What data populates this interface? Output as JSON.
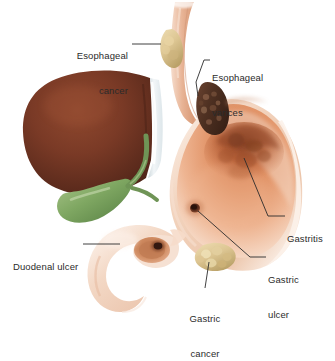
{
  "figure": {
    "background_color": "#ffffff",
    "text_color": "#2b2b2b",
    "leader_line_color": "#2b2b2b"
  },
  "palette": {
    "liver_dark": "#5c2a1d",
    "liver_mid": "#7a3a26",
    "liver_light": "#90492f",
    "liver_edge_white": "#eef2f4",
    "gallbladder_dark": "#5f8a4c",
    "gallbladder_mid": "#7fa762",
    "gallbladder_light": "#a8c489",
    "stomach_wall": "#f0cdb6",
    "stomach_wall_light": "#f8e3d6",
    "stomach_rim": "#fbf0e8",
    "stomach_mucosa": "#e89a6d",
    "gastritis_dark": "#a9552f",
    "varices_dark": "#5d3b2b",
    "varices_speckle": "#8a6048",
    "esophagus_tube": "#e3ab8c",
    "tumor_pale": "#ddc693",
    "tumor_pale_dark": "#c2a872",
    "ulcer_crater": "#3c1d12",
    "duodenum_wall": "#f2d6c2"
  },
  "labels": [
    {
      "id": "esophageal-cancer",
      "name": "esophageal-cancer-label",
      "lines": [
        "Esophageal",
        "cancer"
      ],
      "align": "right",
      "x": 63,
      "y": 27
    },
    {
      "id": "esophageal-varices",
      "name": "esophageal-varices-label",
      "lines": [
        "Esophageal",
        "varices"
      ],
      "align": "left",
      "x": 212,
      "y": 49
    },
    {
      "id": "gastritis",
      "name": "gastritis-label",
      "lines": [
        "Gastritis"
      ],
      "align": "left",
      "x": 287,
      "y": 213
    },
    {
      "id": "gastric-ulcer",
      "name": "gastric-ulcer-label",
      "lines": [
        "Gastric",
        "ulcer"
      ],
      "align": "left",
      "x": 268,
      "y": 255
    },
    {
      "id": "duodenal-ulcer",
      "name": "duodenal-ulcer-label",
      "lines": [
        "Duodenal ulcer"
      ],
      "align": "left",
      "x": 13,
      "y": 240
    },
    {
      "id": "gastric-cancer",
      "name": "gastric-cancer-label",
      "lines": [
        "Gastric",
        "cancer"
      ],
      "align": "center",
      "x": 185,
      "y": 292
    }
  ],
  "organs": [
    {
      "id": "liver",
      "name": "liver-shape",
      "description": "Liver"
    },
    {
      "id": "gallbladder",
      "name": "gallbladder-shape",
      "description": "Gallbladder"
    },
    {
      "id": "esophagus",
      "name": "esophagus-shape",
      "description": "Esophagus"
    },
    {
      "id": "stomach",
      "name": "stomach-shape",
      "description": "Stomach"
    },
    {
      "id": "duodenum",
      "name": "duodenum-shape",
      "description": "Duodenum"
    }
  ],
  "lesions": [
    {
      "id": "esophageal-cancer-mass",
      "name": "esophageal-cancer-lesion"
    },
    {
      "id": "esophageal-varices-mass",
      "name": "esophageal-varices-lesion"
    },
    {
      "id": "gastritis-area",
      "name": "gastritis-lesion"
    },
    {
      "id": "gastric-ulcer-crater",
      "name": "gastric-ulcer-lesion"
    },
    {
      "id": "gastric-cancer-mass",
      "name": "gastric-cancer-lesion"
    },
    {
      "id": "duodenal-ulcer-crater",
      "name": "duodenal-ulcer-lesion"
    }
  ]
}
